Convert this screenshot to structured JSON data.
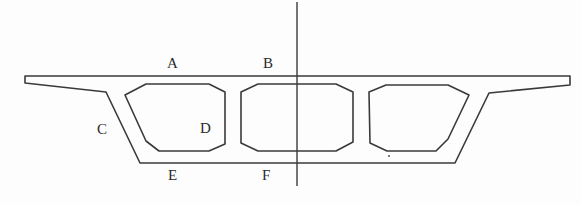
{
  "diagram": {
    "colors": {
      "stroke": "#3a3a3a",
      "background": "#fdfdfd"
    },
    "labels": [
      {
        "id": "A",
        "text": "A",
        "x": 167,
        "y": 56
      },
      {
        "id": "B",
        "text": "B",
        "x": 263,
        "y": 56
      },
      {
        "id": "C",
        "text": "C",
        "x": 97,
        "y": 122
      },
      {
        "id": "D",
        "text": "D",
        "x": 200,
        "y": 121
      },
      {
        "id": "E",
        "text": "E",
        "x": 168,
        "y": 168
      },
      {
        "id": "F",
        "text": "F",
        "x": 262,
        "y": 168
      }
    ],
    "outline": "25,76 570,76 570,85 489,93 455,163 140,163 106,92 25,83",
    "cells": [
      {
        "name": "left-cell",
        "points": "125,95 146,84 209,84 225,92 225,144 209,151 159,151 146,141"
      },
      {
        "name": "middle-cell",
        "points": "241,92 258,84 336,84 353,92 353,142 336,151 258,151 241,143"
      },
      {
        "name": "right-cell",
        "points": "369,92 386,85 448,85 469,95 448,139 436,151 387,151 370,143"
      }
    ],
    "axis": {
      "x": 297,
      "y1": 2,
      "y2": 186
    }
  }
}
